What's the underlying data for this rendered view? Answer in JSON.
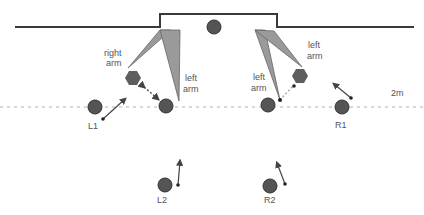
{
  "colors": {
    "wall": "#3a3a3a",
    "player": "#555555",
    "player_stroke": "#333333",
    "wedge_fill": "#9a9a9a",
    "wedge_stroke": "#666666",
    "hexagon": "#5e5e5e",
    "dotted_line": "#b0b0b0",
    "arrow": "#444444",
    "text": "#555555"
  },
  "labels": {
    "left_right_arm_line1": "right",
    "left_right_arm_line2": "arm",
    "left_left_arm_line1": "left",
    "left_left_arm_line2": "arm",
    "right_left_arm_a_line1": "left",
    "right_left_arm_a_line2": "arm",
    "right_left_arm_b_line1": "left",
    "right_left_arm_b_line2": "arm",
    "distance": "2m"
  },
  "players": [
    {
      "id": "L1",
      "label": "L1"
    },
    {
      "id": "R1",
      "label": "R1"
    },
    {
      "id": "L2",
      "label": "L2"
    },
    {
      "id": "R2",
      "label": "R2"
    }
  ]
}
